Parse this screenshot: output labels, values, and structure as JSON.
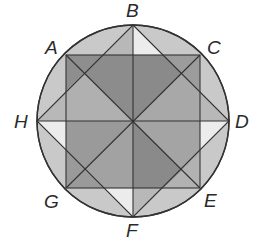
{
  "diagram": {
    "circle": {
      "cx": 133,
      "cy": 121,
      "r": 96,
      "fill": "#c9c9c9",
      "stroke": "#333333"
    },
    "points": {
      "A": {
        "x": 66,
        "y": 55
      },
      "B": {
        "x": 133,
        "y": 25
      },
      "C": {
        "x": 200,
        "y": 55
      },
      "D": {
        "x": 229,
        "y": 121
      },
      "E": {
        "x": 200,
        "y": 188
      },
      "F": {
        "x": 133,
        "y": 217
      },
      "G": {
        "x": 66,
        "y": 188
      },
      "H": {
        "x": 37,
        "y": 121
      },
      "O": {
        "x": 133,
        "y": 121
      }
    },
    "labels": [
      {
        "text": "A",
        "x": 45,
        "y": 54
      },
      {
        "text": "B",
        "x": 126,
        "y": 17
      },
      {
        "text": "C",
        "x": 207,
        "y": 54
      },
      {
        "text": "D",
        "x": 235,
        "y": 128
      },
      {
        "text": "E",
        "x": 204,
        "y": 207
      },
      {
        "text": "F",
        "x": 126,
        "y": 237
      },
      {
        "text": "G",
        "x": 44,
        "y": 208
      },
      {
        "text": "H",
        "x": 14,
        "y": 128
      }
    ],
    "colors": {
      "light": "#ececec",
      "medium": "#b4b4b4",
      "mediumDark": "#9a9a9a",
      "dark": "#858585",
      "line": "#333333"
    }
  }
}
